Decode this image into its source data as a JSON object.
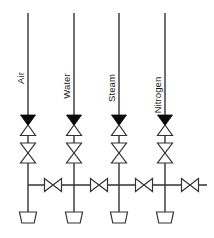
{
  "diagram": {
    "type": "piping-and-instrumentation-diagram",
    "background_color": "#ffffff",
    "line_color": "#333333",
    "fill_color_solid": "#0a0a0a",
    "fill_color_open": "#ffffff",
    "canvas": {
      "width": 214,
      "height": 238
    },
    "header_line": {
      "x_start": 28,
      "x_end": 207,
      "y": 185
    },
    "label_orientation": "rotated-90-ccw",
    "lines": [
      {
        "label": "Air",
        "x": 28,
        "supply_top_y": 13,
        "label_x": 24,
        "label_y": 78,
        "inlet_arrow_y": 115,
        "valve1_y": 125,
        "valve2_y": 143,
        "branch_y": 185,
        "drain_bucket_y": 212,
        "inline_valve_x": 53,
        "components": [
          "supply-line",
          "inlet-arrow",
          "gate-valve-1",
          "gate-valve-2",
          "branch-tee",
          "inline-valve",
          "drain-bucket"
        ]
      },
      {
        "label": "Water",
        "x": 74,
        "supply_top_y": 13,
        "label_x": 70,
        "label_y": 86,
        "inlet_arrow_y": 115,
        "valve1_y": 125,
        "valve2_y": 143,
        "branch_y": 185,
        "drain_bucket_y": 212,
        "inline_valve_x": 99,
        "components": [
          "supply-line",
          "inlet-arrow",
          "gate-valve-1",
          "gate-valve-2",
          "branch-tee",
          "inline-valve",
          "drain-bucket"
        ]
      },
      {
        "label": "Steam",
        "x": 119,
        "supply_top_y": 13,
        "label_x": 115,
        "label_y": 88,
        "inlet_arrow_y": 115,
        "valve1_y": 125,
        "valve2_y": 143,
        "branch_y": 185,
        "drain_bucket_y": 212,
        "inline_valve_x": 144,
        "components": [
          "supply-line",
          "inlet-arrow",
          "gate-valve-1",
          "gate-valve-2",
          "branch-tee",
          "inline-valve",
          "drain-bucket"
        ]
      },
      {
        "label": "Nitrogen",
        "x": 165,
        "supply_top_y": 13,
        "label_x": 161,
        "label_y": 95,
        "inlet_arrow_y": 115,
        "valve1_y": 125,
        "valve2_y": 143,
        "branch_y": 185,
        "drain_bucket_y": 212,
        "inline_valve_x": 190,
        "components": [
          "supply-line",
          "inlet-arrow",
          "gate-valve-1",
          "gate-valve-2",
          "branch-tee",
          "inline-valve",
          "drain-bucket"
        ]
      }
    ]
  }
}
